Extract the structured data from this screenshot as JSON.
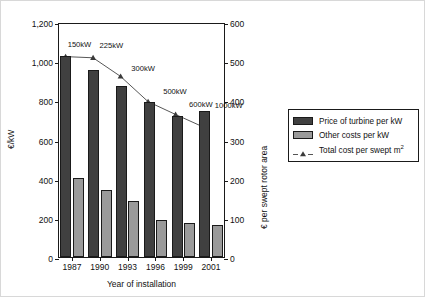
{
  "chart_data": {
    "type": "bar",
    "title": "",
    "xlabel": "Year of installation",
    "ylabel": "€/kW",
    "ylabel_right": "€ per swept rotor area",
    "categories": [
      "1987",
      "1990",
      "1993",
      "1996",
      "1999",
      "2001"
    ],
    "ylim": [
      0,
      1200
    ],
    "yticks": [
      0,
      200,
      400,
      600,
      800,
      1000,
      1200
    ],
    "ytick_labels": [
      "0",
      "200",
      "400",
      "600",
      "800",
      "1,000",
      "1,200"
    ],
    "ylim_right": [
      0,
      600
    ],
    "yticks_right": [
      0,
      100,
      200,
      300,
      400,
      500,
      600
    ],
    "ytick_labels_right": [
      "0",
      "100",
      "200",
      "300",
      "400",
      "500",
      "600"
    ],
    "grid": false,
    "legend_position": "right",
    "series": [
      {
        "name": "Price of turbine per kW",
        "kind": "bar",
        "axis": "left",
        "color": "#404040",
        "values": [
          1025,
          955,
          875,
          790,
          718,
          745
        ]
      },
      {
        "name": "Other costs per kW",
        "kind": "bar",
        "axis": "left",
        "color": "#9a9a9a",
        "values": [
          405,
          340,
          285,
          190,
          172,
          163
        ]
      },
      {
        "name": "Total cost per swept m²",
        "kind": "line",
        "axis": "right",
        "color": "#555555",
        "marker": "triangle",
        "values": [
          516,
          513,
          465,
          400,
          367,
          335
        ]
      }
    ],
    "point_annotations": [
      "150kW",
      "225kW",
      "300kW",
      "500kW",
      "600kW",
      "1000kW"
    ]
  },
  "legend": {
    "items": [
      {
        "label": "Price of turbine per kW",
        "swatch": "dark-gray-swatch"
      },
      {
        "label": "Other costs per kW",
        "swatch": "light-gray-swatch"
      },
      {
        "label": "Total cost per swept m",
        "superscript": "2",
        "swatch": "line-marker-icon"
      }
    ]
  }
}
